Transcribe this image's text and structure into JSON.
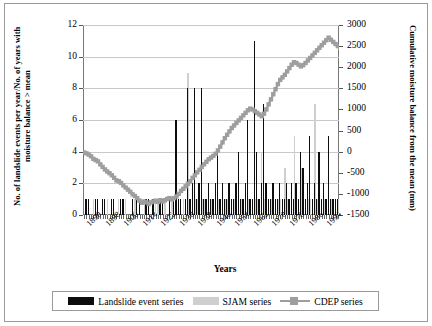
{
  "chart_data": {
    "type": "bar",
    "title": "",
    "xlabel": "Years",
    "ylabel": "No. of landslide events per year/No. of years with moisture balance > mean",
    "ylabel_right": "Cumulative moisture balance from the mean (mm)",
    "ylim": [
      0,
      12
    ],
    "yticks": [
      "0",
      "2",
      "4",
      "6",
      "8",
      "10",
      "12"
    ],
    "ylim_right": [
      -1500,
      3000
    ],
    "yticks_right": [
      "-1500",
      "-1000",
      "-500",
      "0",
      "500",
      "1000",
      "1500",
      "2000",
      "2500",
      "3000"
    ],
    "grid": true,
    "legend_position": "bottom",
    "x_start": 1889,
    "x_end": 1999,
    "xticks": [
      "1890",
      "1898",
      "1906",
      "1914",
      "1922",
      "1930",
      "1938",
      "1946",
      "1954",
      "1962",
      "1970",
      "1978",
      "1986",
      "1994"
    ],
    "series": [
      {
        "name": "Landslide event series",
        "type": "bar",
        "color": "#0d0d0d",
        "axis": "left",
        "values": [
          0,
          1,
          1,
          0,
          0,
          1,
          1,
          0,
          1,
          1,
          0,
          0,
          1,
          1,
          0,
          0,
          1,
          1,
          0,
          0,
          0,
          1,
          0,
          1,
          1,
          0,
          0,
          1,
          1,
          0,
          1,
          0,
          0,
          1,
          1,
          0,
          0,
          1,
          0,
          1,
          6,
          1,
          1,
          0,
          1,
          8,
          1,
          2,
          8,
          1,
          2,
          8,
          1,
          1,
          2,
          1,
          1,
          2,
          4,
          1,
          2,
          1,
          1,
          2,
          1,
          1,
          2,
          4,
          1,
          1,
          2,
          6,
          1,
          1,
          11,
          4,
          1,
          2,
          7,
          2,
          1,
          1,
          2,
          1,
          1,
          2,
          1,
          1,
          2,
          1,
          2,
          1,
          2,
          1,
          4,
          3,
          1,
          2,
          5,
          1,
          2,
          1,
          4,
          1,
          2,
          1,
          5,
          1,
          1,
          1,
          1
        ]
      },
      {
        "name": "SJAM series",
        "type": "bar",
        "color": "#cfcfcf",
        "axis": "left",
        "values": [
          0,
          0,
          0,
          0,
          1,
          0,
          0,
          0,
          0,
          0,
          1,
          0,
          0,
          0,
          0,
          1,
          0,
          0,
          1,
          0,
          0,
          0,
          1,
          0,
          0,
          0,
          1,
          1,
          0,
          0,
          0,
          1,
          1,
          0,
          0,
          1,
          0,
          0,
          1,
          0,
          1,
          1,
          0,
          1,
          1,
          9,
          1,
          1,
          1,
          1,
          1,
          1,
          1,
          1,
          1,
          1,
          1,
          1,
          1,
          1,
          1,
          1,
          1,
          1,
          1,
          1,
          1,
          1,
          1,
          1,
          1,
          1,
          1,
          1,
          1,
          1,
          1,
          4,
          1,
          1,
          1,
          1,
          1,
          1,
          1,
          1,
          1,
          3,
          1,
          1,
          1,
          5,
          1,
          1,
          3,
          1,
          1,
          1,
          1,
          1,
          7,
          1,
          1,
          1,
          1,
          1,
          1,
          1,
          1,
          1,
          1
        ]
      },
      {
        "name": "CDEP series",
        "type": "line",
        "color": "#9e9e9e",
        "axis": "right",
        "values": [
          -20,
          -40,
          -70,
          -110,
          -170,
          -200,
          -230,
          -300,
          -360,
          -420,
          -470,
          -510,
          -560,
          -620,
          -680,
          -700,
          -740,
          -800,
          -850,
          -900,
          -950,
          -1010,
          -1050,
          -1100,
          -1160,
          -1210,
          -1180,
          -1200,
          -1240,
          -1200,
          -1180,
          -1160,
          -1190,
          -1150,
          -1180,
          -1150,
          -1120,
          -1100,
          -1130,
          -1100,
          -1060,
          -1000,
          -930,
          -880,
          -820,
          -760,
          -700,
          -620,
          -560,
          -490,
          -430,
          -360,
          -300,
          -240,
          -180,
          -140,
          -100,
          -50,
          30,
          120,
          220,
          320,
          400,
          480,
          560,
          620,
          680,
          740,
          800,
          860,
          920,
          980,
          1020,
          1000,
          960,
          920,
          880,
          840,
          900,
          1000,
          1120,
          1240,
          1360,
          1480,
          1600,
          1700,
          1760,
          1820,
          1900,
          1980,
          2060,
          2120,
          2100,
          2060,
          2020,
          2050,
          2100,
          2160,
          2220,
          2280,
          2340,
          2400,
          2460,
          2520,
          2580,
          2640,
          2700,
          2650,
          2600,
          2550,
          2500,
          2450,
          2400,
          2350,
          2300
        ]
      }
    ]
  },
  "legend": {
    "items": [
      {
        "label": "Landslide event series",
        "swatch": "black-bar-swatch"
      },
      {
        "label": "SJAM series",
        "swatch": "gray-bar-swatch"
      },
      {
        "label": "CDEP series",
        "swatch": "gray-line-marker-swatch"
      }
    ]
  }
}
